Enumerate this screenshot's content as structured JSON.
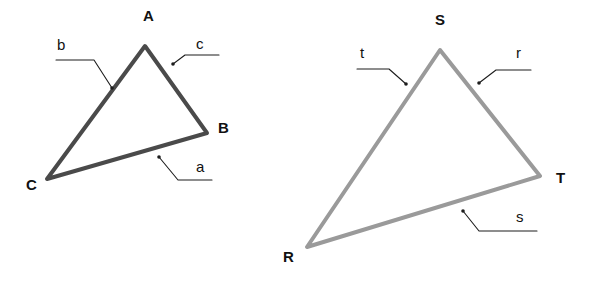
{
  "diagram": {
    "background_color": "#ffffff",
    "label_color": "#111111",
    "leader_color": "#1d1d1d"
  },
  "triangles": [
    {
      "id": "abc",
      "name": "triangle-abc",
      "stroke_color": "#4a4a4a",
      "stroke_width": 4,
      "vertices": [
        {
          "label": "A",
          "x": 145,
          "y": 46,
          "label_x": 143,
          "label_y": 21
        },
        {
          "label": "B",
          "x": 207,
          "y": 133,
          "label_x": 218,
          "label_y": 133
        },
        {
          "label": "C",
          "x": 47,
          "y": 179,
          "label_x": 26,
          "label_y": 190
        }
      ],
      "sides": [
        {
          "label": "a",
          "label_x": 196,
          "label_y": 172,
          "anchor_x": 159,
          "anchor_y": 157,
          "elbow_x": 178,
          "elbow_y": 180,
          "end_x": 212,
          "end_y": 180
        },
        {
          "label": "b",
          "label_x": 57,
          "label_y": 50,
          "anchor_x": 112,
          "anchor_y": 88,
          "elbow_x": 94,
          "elbow_y": 60,
          "end_x": 56,
          "end_y": 60
        },
        {
          "label": "c",
          "label_x": 196,
          "label_y": 49,
          "anchor_x": 173,
          "anchor_y": 64,
          "elbow_x": 185,
          "elbow_y": 55,
          "end_x": 219,
          "end_y": 55
        }
      ]
    },
    {
      "id": "rst",
      "name": "triangle-rst",
      "stroke_color": "#9a9a9a",
      "stroke_width": 4,
      "vertices": [
        {
          "label": "S",
          "x": 440,
          "y": 50,
          "label_x": 435,
          "label_y": 25
        },
        {
          "label": "T",
          "x": 540,
          "y": 176,
          "label_x": 556,
          "label_y": 183
        },
        {
          "label": "R",
          "x": 307,
          "y": 247,
          "label_x": 283,
          "label_y": 262
        }
      ],
      "sides": [
        {
          "label": "r",
          "label_x": 516,
          "label_y": 58,
          "anchor_x": 479,
          "anchor_y": 83,
          "elbow_x": 496,
          "elbow_y": 70,
          "end_x": 531,
          "end_y": 70
        },
        {
          "label": "s",
          "label_x": 516,
          "label_y": 222,
          "anchor_x": 463,
          "anchor_y": 211,
          "elbow_x": 479,
          "elbow_y": 231,
          "end_x": 537,
          "end_y": 231
        },
        {
          "label": "t",
          "label_x": 360,
          "label_y": 58,
          "anchor_x": 406,
          "anchor_y": 84,
          "elbow_x": 389,
          "elbow_y": 69,
          "end_x": 357,
          "end_y": 69
        }
      ]
    }
  ]
}
